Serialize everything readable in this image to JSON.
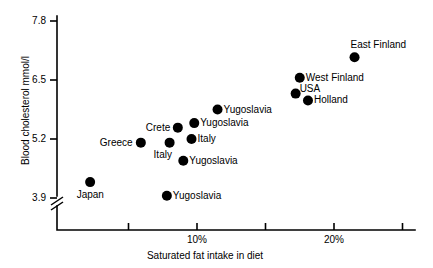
{
  "chart_data": {
    "type": "scatter",
    "title": "",
    "xlabel": "Saturated fat intake in diet",
    "ylabel": "Blood cholesterol mmol/l",
    "xlim": [
      0,
      25
    ],
    "ylim": [
      3.9,
      7.8
    ],
    "y_axis_break": true,
    "grid": false,
    "legend": "none",
    "xticks": [
      {
        "value": 5,
        "label": ""
      },
      {
        "value": 10,
        "label": "10%"
      },
      {
        "value": 15,
        "label": ""
      },
      {
        "value": 20,
        "label": "20%"
      },
      {
        "value": 25,
        "label": ""
      }
    ],
    "yticks": [
      {
        "value": 3.9,
        "label": "3.9"
      },
      {
        "value": 5.2,
        "label": "5.2"
      },
      {
        "value": 6.5,
        "label": "6.5"
      },
      {
        "value": 7.8,
        "label": "7.8"
      }
    ],
    "points": [
      {
        "name": "Japan",
        "x": 2.2,
        "y": 4.25,
        "label": "Japan",
        "label_pos": "below"
      },
      {
        "name": "Greece",
        "x": 5.9,
        "y": 5.12,
        "label": "Greece",
        "label_pos": "left"
      },
      {
        "name": "Yugoslavia-1",
        "x": 7.8,
        "y": 3.95,
        "label": "Yugoslavia",
        "label_pos": "right"
      },
      {
        "name": "Italy-1",
        "x": 8.0,
        "y": 5.12,
        "label": "Italy",
        "label_pos": "below-left"
      },
      {
        "name": "Crete",
        "x": 8.6,
        "y": 5.45,
        "label": "Crete",
        "label_pos": "left"
      },
      {
        "name": "Yugoslavia-2",
        "x": 9.0,
        "y": 4.72,
        "label": "Yugoslavia",
        "label_pos": "right"
      },
      {
        "name": "Italy-2",
        "x": 9.6,
        "y": 5.2,
        "label": "Italy",
        "label_pos": "right"
      },
      {
        "name": "Yugoslavia-3",
        "x": 9.8,
        "y": 5.55,
        "label": "Yugoslavia",
        "label_pos": "right"
      },
      {
        "name": "Yugoslavia-4",
        "x": 11.5,
        "y": 5.85,
        "label": "Yugoslavia",
        "label_pos": "right"
      },
      {
        "name": "USA",
        "x": 17.2,
        "y": 6.2,
        "label": "USA",
        "label_pos": "right-above"
      },
      {
        "name": "West Finland",
        "x": 17.5,
        "y": 6.55,
        "label": "West Finland",
        "label_pos": "right"
      },
      {
        "name": "Holland",
        "x": 18.1,
        "y": 6.05,
        "label": "Holland",
        "label_pos": "right"
      },
      {
        "name": "East Finland",
        "x": 21.5,
        "y": 7.0,
        "label": "East Finland",
        "label_pos": "above-right"
      }
    ]
  }
}
